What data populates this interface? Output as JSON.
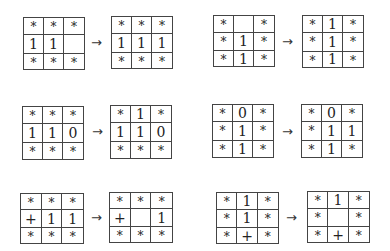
{
  "arrow_symbol": "→",
  "transitions": [
    {
      "before": [
        "*",
        "*",
        "*",
        "1",
        "1",
        "",
        "*",
        "*",
        "*"
      ],
      "after": [
        "*",
        "*",
        "*",
        "1",
        "1",
        "1",
        "*",
        "*",
        "*"
      ]
    },
    {
      "before": [
        "*",
        "",
        "*",
        "*",
        "1",
        "*",
        "*",
        "1",
        "*"
      ],
      "after": [
        "*",
        "1",
        "*",
        "*",
        "1",
        "*",
        "*",
        "1",
        "*"
      ]
    },
    {
      "before": [
        "*",
        "*",
        "*",
        "1",
        "1",
        "0",
        "*",
        "*",
        "*"
      ],
      "after": [
        "*",
        "1",
        "*",
        "1",
        "1",
        "0",
        "*",
        "*",
        "*"
      ]
    },
    {
      "before": [
        "*",
        "0",
        "*",
        "*",
        "1",
        "*",
        "*",
        "1",
        "*"
      ],
      "after": [
        "*",
        "0",
        "*",
        "*",
        "1",
        "1",
        "*",
        "1",
        "*"
      ]
    },
    {
      "before": [
        "*",
        "*",
        "*",
        "+",
        "1",
        "1",
        "*",
        "*",
        "*"
      ],
      "after": [
        "*",
        "*",
        "*",
        "+",
        "",
        "1",
        "*",
        "*",
        "*"
      ]
    },
    {
      "before": [
        "*",
        "1",
        "*",
        "*",
        "1",
        "*",
        "*",
        "+",
        "*"
      ],
      "after": [
        "*",
        "1",
        "*",
        "*",
        "",
        "*",
        "*",
        "+",
        "*"
      ]
    }
  ]
}
